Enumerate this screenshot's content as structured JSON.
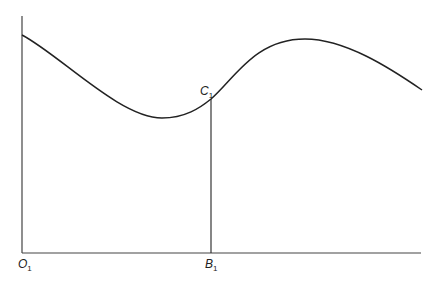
{
  "diagram": {
    "type": "curve-with-ordinate",
    "labels": {
      "origin": {
        "main": "O",
        "sub": "1"
      },
      "point_on_curve": {
        "main": "C",
        "sub": "1"
      },
      "foot_on_axis": {
        "main": "B",
        "sub": "1"
      }
    },
    "colors": {
      "stroke": "#222222",
      "axis": "#444444",
      "background": "#ffffff"
    },
    "geometry": {
      "origin": [
        22,
        253
      ],
      "y_axis_top": [
        22,
        16
      ],
      "x_axis_end": [
        421,
        253
      ],
      "curve_start": [
        22,
        35
      ],
      "curve_min": [
        162,
        118
      ],
      "curve_point_C1": [
        211,
        99
      ],
      "curve_peak": [
        305,
        39
      ],
      "curve_end": [
        422,
        90
      ],
      "ordinate_x": 211
    }
  }
}
